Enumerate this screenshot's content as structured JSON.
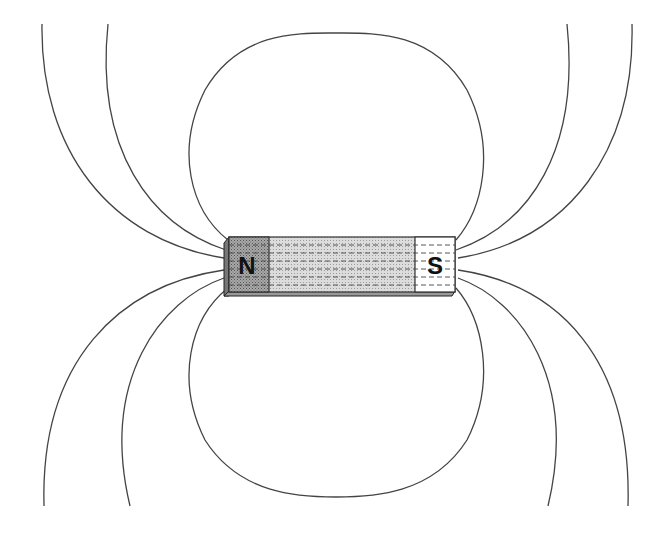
{
  "diagram": {
    "north_label": "N",
    "south_label": "S",
    "colors": {
      "line": "#444444",
      "magnet_body": "#d2d2d2",
      "north_end": "#9a9a9a",
      "south_end": "#ffffff"
    }
  }
}
